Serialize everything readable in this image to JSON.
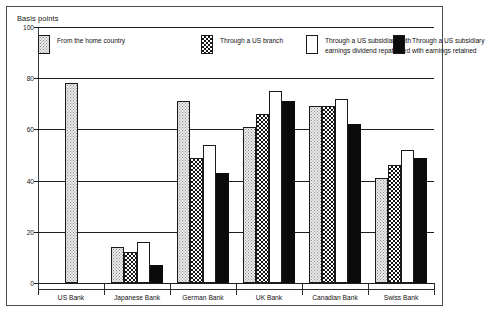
{
  "chart_data": {
    "type": "bar",
    "title": "",
    "ylabel": "Basis points",
    "xlabel": "",
    "ylim": [
      0,
      100
    ],
    "yticks": [
      0,
      20,
      40,
      60,
      80,
      100
    ],
    "ytick_labels": [
      "0",
      "20",
      "40",
      "60",
      "80",
      "100"
    ],
    "grid": true,
    "legend_position": "top-inside",
    "categories": [
      "US Bank",
      "Japanese Bank",
      "German Bank",
      "UK Bank",
      "Canadian Bank",
      "Swiss Bank"
    ],
    "series": [
      {
        "name": "From the home country",
        "pattern": "light-dots",
        "values": [
          78,
          14,
          71,
          61,
          69,
          41
        ]
      },
      {
        "name": "Through a US branch",
        "pattern": "dark-crosshatch",
        "values": [
          null,
          12,
          49,
          66,
          69,
          46
        ]
      },
      {
        "name": "Through a US subsidiary with earnings dividend repatriated",
        "pattern": "white",
        "values": [
          null,
          16,
          54,
          75,
          72,
          52
        ]
      },
      {
        "name": "Through a US subsidiary with earnings retained",
        "pattern": "solid-black",
        "values": [
          null,
          7,
          43,
          71,
          62,
          49
        ]
      }
    ]
  },
  "legend": {
    "items": [
      {
        "label_lines": [
          "From the home country"
        ],
        "pattern": "light-dots"
      },
      {
        "label_lines": [
          "Through a US branch"
        ],
        "pattern": "dark-crosshatch"
      },
      {
        "label_lines": [
          "Through a US  subsidiary with",
          "earnings  dividend repatriated"
        ],
        "pattern": "white"
      },
      {
        "label_lines": [
          "Through a US subsidiary",
          "with earnings retained"
        ],
        "pattern": "solid-black"
      }
    ]
  },
  "colors": {
    "axis": "#1d1d1d",
    "border": "#4a4a4a",
    "background": "#ffffff",
    "series_black": "#0b0b0b",
    "series_light": "#eceaea"
  }
}
